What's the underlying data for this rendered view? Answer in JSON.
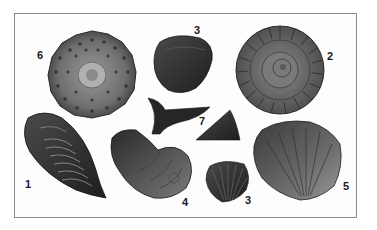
{
  "figure": {
    "specimens": [
      {
        "number": "1",
        "name": "trilobite"
      },
      {
        "number": "2",
        "name": "ammonite"
      },
      {
        "number": "3",
        "name": "brachiopod (top)"
      },
      {
        "number": "3",
        "name": "brachiopod (bottom)"
      },
      {
        "number": "4",
        "name": "nautiloid"
      },
      {
        "number": "5",
        "name": "large brachiopod"
      },
      {
        "number": "6",
        "name": "echinoid (sea urchin)"
      },
      {
        "number": "7",
        "name": "shark tooth and conical tooth"
      }
    ],
    "labels": {
      "l1": "1",
      "l2": "2",
      "l3a": "3",
      "l3b": "3",
      "l4": "4",
      "l5": "5",
      "l6": "6",
      "l7": "7"
    },
    "colors": {
      "background": "#ffffff",
      "frame": "#8a8a8a",
      "fossil_dark": "#2e2e2e",
      "fossil_mid": "#6a6a6a",
      "fossil_light": "#a8a8a8"
    }
  }
}
